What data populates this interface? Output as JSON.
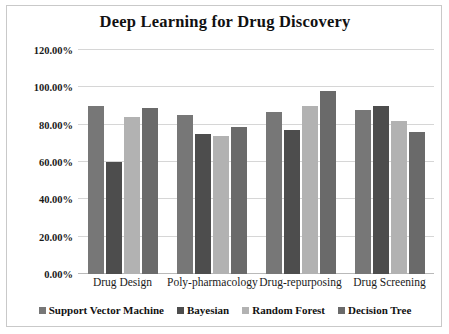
{
  "chart_data": {
    "type": "bar",
    "title": "Deep Learning for Drug Discovery",
    "xlabel": "",
    "ylabel": "",
    "ylim": [
      0,
      120
    ],
    "ytick_labels": [
      "0.00%",
      "20.00%",
      "40.00%",
      "60.00%",
      "80.00%",
      "100.00%",
      "120.00%"
    ],
    "ytick_values": [
      0,
      20,
      40,
      60,
      80,
      100,
      120
    ],
    "grid": true,
    "legend_position": "bottom",
    "categories": [
      "Drug Design",
      "Poly-pharmacology",
      "Drug-repurposing",
      "Drug Screening"
    ],
    "series": [
      {
        "name": "Support Vector Machine",
        "color": "#777777",
        "values": [
          90,
          85,
          87,
          88
        ]
      },
      {
        "name": "Bayesian",
        "color": "#4d4d4d",
        "values": [
          60,
          75,
          77,
          90
        ]
      },
      {
        "name": "Random Forest",
        "color": "#b2b2b2",
        "values": [
          84,
          74,
          90,
          82
        ]
      },
      {
        "name": "Decision Tree",
        "color": "#6a6a6a",
        "values": [
          89,
          79,
          98,
          76
        ]
      }
    ]
  }
}
